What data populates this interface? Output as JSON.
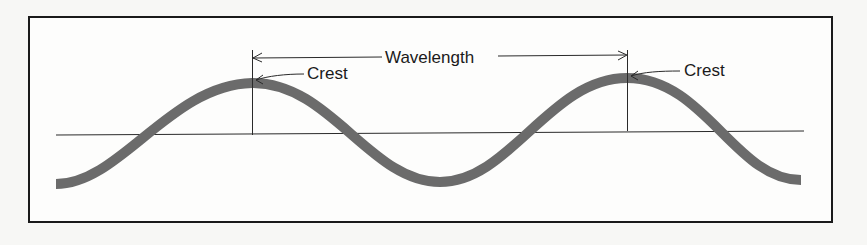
{
  "diagram": {
    "labels": {
      "wavelength": "Wavelength",
      "crest_left": "Crest",
      "crest_right": "Crest"
    },
    "colors": {
      "wave": "#6b6b6b",
      "lines": "#2a2a2a",
      "frame": "#1a1a1a",
      "background": "#fdfdfc"
    },
    "elements": [
      {
        "type": "sine-wave",
        "periods": 2,
        "description": "thick gray wave from trough through crest, trough, crest to trough"
      },
      {
        "type": "baseline",
        "description": "horizontal rest line"
      },
      {
        "type": "dimension-arrow",
        "label": "Wavelength",
        "from": "crest 1",
        "to": "crest 2"
      },
      {
        "type": "pointer",
        "label": "Crest",
        "target": "crest 1"
      },
      {
        "type": "pointer",
        "label": "Crest",
        "target": "crest 2"
      }
    ]
  }
}
